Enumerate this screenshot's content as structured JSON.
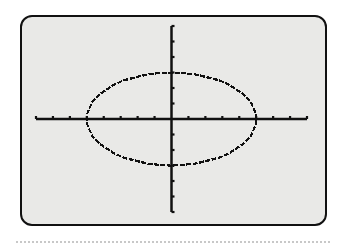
{
  "chart_data": {
    "type": "line",
    "title": "",
    "xlabel": "",
    "ylabel": "",
    "xlim": [
      -8,
      8
    ],
    "ylim": [
      -6,
      6
    ],
    "xtick_step": 1,
    "ytick_step": 1,
    "grid": false,
    "series": [
      {
        "name": "ellipse",
        "equation": "x^2/25 + y^2/9 = 1",
        "center": [
          0,
          0
        ],
        "semi_axis_x": 5,
        "semi_axis_y": 3
      }
    ]
  },
  "colors": {
    "screen_bg": "#e9e9e7",
    "ink": "#111111",
    "frame": "#111111"
  }
}
